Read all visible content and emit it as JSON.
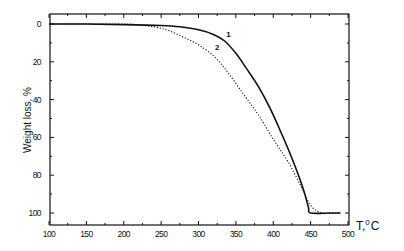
{
  "chart_data": {
    "type": "line",
    "title": "",
    "xlabel": "T, °C",
    "xlabel_parts": {
      "main": "T,",
      "sup": "0",
      "unit": "C"
    },
    "ylabel": "Weight loss, %",
    "xlim": [
      100,
      500
    ],
    "ylim": [
      0,
      100
    ],
    "y_inverted": true,
    "grid": false,
    "legend": "inline curve labels",
    "x_ticks": [
      100,
      150,
      200,
      250,
      300,
      350,
      400,
      450,
      500
    ],
    "y_ticks": [
      0,
      20,
      40,
      60,
      80,
      100
    ],
    "series": [
      {
        "name": "1",
        "style": "solid",
        "label_at": [
          337,
          7
        ],
        "x": [
          100,
          150,
          200,
          250,
          275,
          300,
          320,
          335,
          350,
          365,
          380,
          395,
          410,
          425,
          440,
          447,
          450,
          475,
          490
        ],
        "y": [
          0,
          0,
          0.3,
          0.8,
          1.5,
          3,
          5.5,
          9,
          15.5,
          24,
          33,
          44,
          57,
          71,
          87,
          97,
          100,
          100,
          100
        ]
      },
      {
        "name": "2",
        "style": "dotted",
        "label_at": [
          322,
          14
        ],
        "x": [
          100,
          200,
          215,
          240,
          260,
          280,
          300,
          322,
          340,
          360,
          380,
          400,
          420,
          440,
          450,
          465,
          490
        ],
        "y": [
          0,
          0,
          0.3,
          1.5,
          3.5,
          7,
          11,
          17.5,
          26,
          37,
          48,
          61,
          73,
          88,
          96,
          100,
          100
        ]
      }
    ]
  }
}
